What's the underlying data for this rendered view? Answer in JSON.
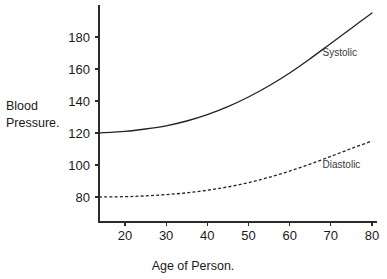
{
  "chart_data": {
    "type": "line",
    "title": "",
    "xlabel": "Age of Person.",
    "ylabel_line1": "Blood",
    "ylabel_line2": "Pressure.",
    "xlim": [
      13.7,
      80
    ],
    "ylim": [
      68,
      196
    ],
    "grid": false,
    "legend_position": "inline-right",
    "x_ticks": [
      20,
      30,
      40,
      50,
      60,
      70,
      80
    ],
    "x_tick_labels": [
      "20",
      "30",
      "40",
      "50",
      "60",
      "70",
      "80"
    ],
    "y_ticks": [
      80,
      100,
      120,
      140,
      160,
      180
    ],
    "y_tick_labels": [
      "80",
      "100",
      "120",
      "140",
      "160",
      "180"
    ],
    "series": [
      {
        "name": "Systolic",
        "style": "solid",
        "label": "Systolic",
        "label_x": 68,
        "label_y": 168,
        "x": [
          13.7,
          20,
          25,
          30,
          35,
          40,
          45,
          50,
          55,
          60,
          65,
          70,
          75,
          80
        ],
        "values": [
          120,
          121,
          122.5,
          124.5,
          127.5,
          131.5,
          136.5,
          142.5,
          149.5,
          157.5,
          166.5,
          176,
          185.5,
          195
        ]
      },
      {
        "name": "Diastolic",
        "style": "dashed",
        "label": "Diastolic",
        "label_x": 68,
        "label_y": 98,
        "x": [
          13.7,
          20,
          25,
          30,
          35,
          40,
          45,
          50,
          55,
          60,
          65,
          70,
          75,
          80
        ],
        "values": [
          80,
          80.2,
          80.7,
          81.5,
          82.6,
          84.2,
          86.3,
          89,
          92.3,
          96.2,
          100.6,
          105.4,
          110.3,
          115
        ]
      }
    ]
  },
  "axis_titles": {
    "x": "Age of Person.",
    "y_line1": "Blood",
    "y_line2": "Pressure."
  }
}
